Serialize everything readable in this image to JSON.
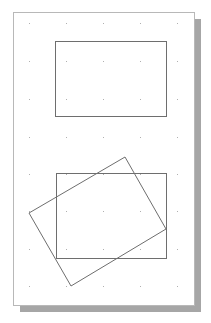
{
  "page": {
    "x": 13,
    "y": 12,
    "width": 181,
    "height": 293,
    "fill": "#ffffff",
    "border": "#b8b8b8",
    "shadow": {
      "dx": 7,
      "dy": 7,
      "color": "#a6a6a6"
    }
  },
  "grid": {
    "dot_color": "#b0b0b0",
    "xs": [
      29,
      66,
      103,
      140,
      177
    ],
    "ys": [
      23,
      61,
      99,
      137,
      174,
      211,
      249,
      286
    ]
  },
  "shapes": [
    {
      "name": "rectangle-top",
      "type": "rect",
      "x": 55,
      "y": 41,
      "width": 111,
      "height": 75,
      "stroke": "#6e6e6e"
    },
    {
      "name": "rectangle-bottom",
      "type": "rect",
      "x": 56,
      "y": 173,
      "width": 110,
      "height": 85,
      "stroke": "#6e6e6e"
    },
    {
      "name": "rotated-rectangle",
      "type": "polygon",
      "points": "125,157 166,229 71,286 29,213",
      "stroke": "#6e6e6e"
    }
  ]
}
